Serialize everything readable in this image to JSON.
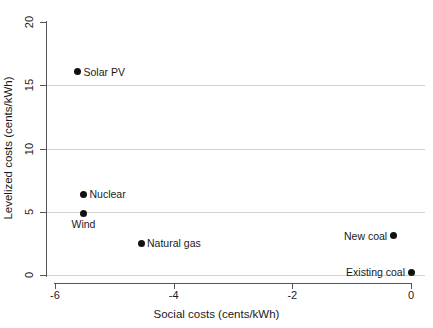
{
  "chart_data": {
    "type": "scatter",
    "title": "",
    "xlabel": "Social costs (cents/kWh)",
    "ylabel": "Levelized costs (cents/kWh)",
    "xlim": [
      -6.6,
      0.35
    ],
    "ylim": [
      -0.6,
      20.5
    ],
    "xticks": [
      -6,
      -4,
      -2,
      0
    ],
    "xticklabels": [
      "-6",
      "-4",
      "-2",
      "0"
    ],
    "yticks": [
      0,
      5,
      10,
      15,
      20
    ],
    "yticklabels": [
      "0",
      "5",
      "10",
      "15",
      "20"
    ],
    "grid": "horizontal gridlines at y = 0, 5, 10, 15 (light gray)",
    "legend": "none (points labelled directly)",
    "point_color": "#111111",
    "grid_color": "#d3d3d3",
    "axis_color": "#555555",
    "points": [
      {
        "label": "Solar PV",
        "x": -5.62,
        "y": 16.05,
        "label_pos": "right"
      },
      {
        "label": "Nuclear",
        "x": -5.52,
        "y": 6.4,
        "label_pos": "right"
      },
      {
        "label": "Wind",
        "x": -5.52,
        "y": 4.9,
        "label_pos": "below"
      },
      {
        "label": "Natural gas",
        "x": -4.55,
        "y": 2.5,
        "label_pos": "right"
      },
      {
        "label": "New coal",
        "x": -0.3,
        "y": 3.1,
        "label_pos": "left"
      },
      {
        "label": "Existing coal",
        "x": 0.0,
        "y": 0.2,
        "label_pos": "left"
      }
    ]
  }
}
